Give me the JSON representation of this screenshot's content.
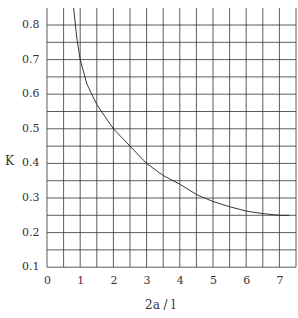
{
  "chart_data": {
    "type": "line",
    "title": "",
    "xlabel": "2a / l",
    "ylabel": "K",
    "xlim": [
      0,
      7.5
    ],
    "ylim": [
      0.1,
      0.85
    ],
    "xticks": [
      "0",
      "1",
      "2",
      "3",
      "4",
      "5",
      "6",
      "7"
    ],
    "yticks": [
      "0.8",
      "0.7",
      "0.6",
      "0.5",
      "0.4",
      "0.3",
      "0.2",
      "0.1"
    ],
    "grid": true,
    "grid_x_step": 0.5,
    "grid_y_step": 0.05,
    "series": [
      {
        "name": "K",
        "x": [
          0.8,
          0.9,
          1.0,
          1.2,
          1.5,
          2.0,
          2.5,
          3.0,
          3.5,
          4.0,
          4.5,
          5.0,
          5.5,
          6.0,
          6.5,
          7.0,
          7.3
        ],
        "y": [
          0.85,
          0.76,
          0.7,
          0.63,
          0.57,
          0.5,
          0.45,
          0.4,
          0.365,
          0.34,
          0.31,
          0.29,
          0.275,
          0.262,
          0.255,
          0.25,
          0.25
        ]
      }
    ]
  }
}
